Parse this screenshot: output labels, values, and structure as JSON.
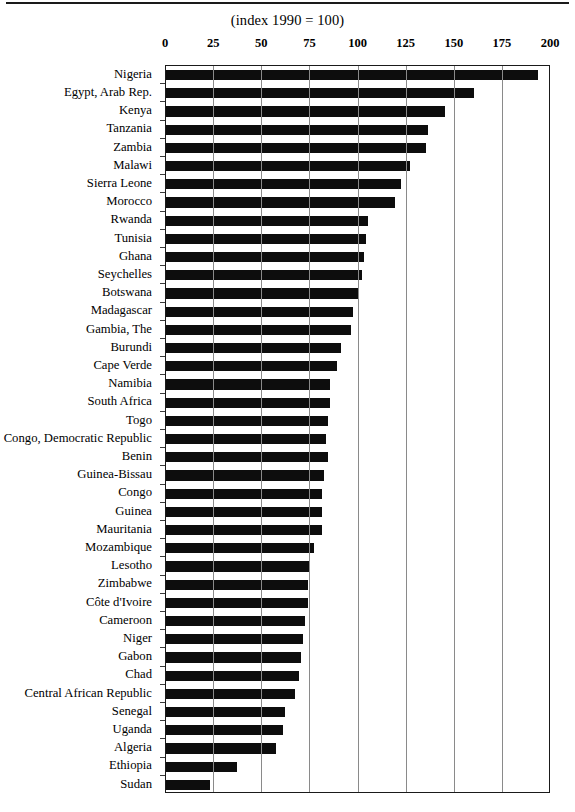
{
  "chart_data": {
    "type": "bar",
    "orientation": "horizontal",
    "title": "(index 1990 = 100)",
    "xlabel": "",
    "ylabel": "",
    "xlim": [
      0,
      200
    ],
    "xticks": [
      0,
      25,
      50,
      75,
      100,
      125,
      150,
      175,
      200
    ],
    "grid": true,
    "legend": null,
    "bar_color": "#0d0d0d",
    "categories": [
      "Nigeria",
      "Egypt,  Arab Rep.",
      "Kenya",
      "Tanzania",
      "Zambia",
      "Malawi",
      "Sierra Leone",
      "Morocco",
      "Rwanda",
      "Tunisia",
      "Ghana",
      "Seychelles",
      "Botswana",
      "Madagascar",
      "Gambia, The",
      "Burundi",
      "Cape Verde",
      "Namibia",
      "South Africa",
      "Togo",
      "Congo, Democratic  Republic",
      "Benin",
      "Guinea-Bissau",
      "Congo",
      "Guinea",
      "Mauritania",
      "Mozambique",
      "Lesotho",
      "Zimbabwe",
      "Côte d'Ivoire",
      "Cameroon",
      "Niger",
      "Gabon",
      "Chad",
      "Central African Republic",
      "Senegal",
      "Uganda",
      "Algeria",
      "Ethiopia",
      "Sudan"
    ],
    "values": [
      193,
      160,
      145,
      136,
      135,
      127,
      122,
      119,
      105,
      104,
      103,
      102,
      100,
      97,
      96,
      91,
      89,
      85,
      85,
      84,
      83,
      84,
      82,
      81,
      81,
      81,
      77,
      75,
      74,
      74,
      72,
      71,
      70,
      69,
      67,
      62,
      61,
      57,
      37,
      23
    ]
  },
  "axis": {
    "tick_labels": [
      "0",
      "25",
      "50",
      "75",
      "100",
      "125",
      "150",
      "175",
      "200"
    ]
  }
}
